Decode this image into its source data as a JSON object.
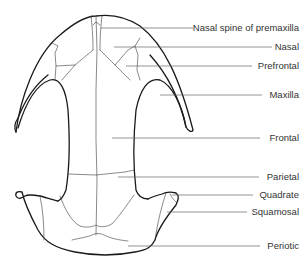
{
  "diagram": {
    "labels": [
      {
        "id": "nasal-spine",
        "text": "Nasal spine of premaxilla",
        "y": 28
      },
      {
        "id": "nasal",
        "text": "Nasal",
        "y": 47
      },
      {
        "id": "prefrontal",
        "text": "Prefrontal",
        "y": 66
      },
      {
        "id": "maxilla",
        "text": "Maxilla",
        "y": 95
      },
      {
        "id": "frontal",
        "text": "Frontal",
        "y": 138
      },
      {
        "id": "parietal",
        "text": "Parietal",
        "y": 177
      },
      {
        "id": "quadrate",
        "text": "Quadrate",
        "y": 195
      },
      {
        "id": "squamosal",
        "text": "Squamosal",
        "y": 212
      },
      {
        "id": "periotic",
        "text": "Periotic",
        "y": 246
      }
    ],
    "colors": {
      "outline": "#1a1a1a",
      "suture": "#3a3a3a",
      "leader": "#666666",
      "text": "#333333",
      "background": "#ffffff"
    }
  }
}
